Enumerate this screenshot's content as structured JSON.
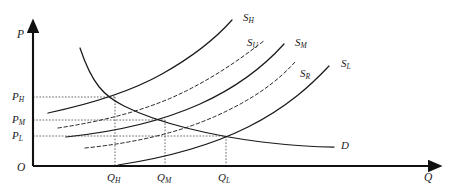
{
  "figure": {
    "kind": "supply-demand-diagram",
    "background": "#ffffff",
    "ink": "#1a1a1a",
    "guide_color": "#555555"
  },
  "axes": {
    "y_label": "P",
    "x_label": "Q",
    "origin_label": "O",
    "x_axis_y": 166,
    "y_axis_x": 33,
    "y_top": 27,
    "x_right": 436
  },
  "price_ticks": [
    {
      "id": "PH",
      "base": "P",
      "sub": "H",
      "y": 97
    },
    {
      "id": "PM",
      "base": "P",
      "sub": "M",
      "y": 120
    },
    {
      "id": "PL",
      "base": "P",
      "sub": "L",
      "y": 136
    }
  ],
  "quantity_ticks": [
    {
      "id": "QH",
      "base": "Q",
      "sub": "H",
      "x": 115
    },
    {
      "id": "QM",
      "base": "Q",
      "sub": "M",
      "x": 165
    },
    {
      "id": "QL",
      "base": "Q",
      "sub": "L",
      "x": 226
    }
  ],
  "equilibria": [
    {
      "name": "high",
      "price": "PH",
      "quantity": "QH",
      "x": 115,
      "y": 97
    },
    {
      "name": "medium",
      "price": "PM",
      "quantity": "QM",
      "x": 165,
      "y": 120
    },
    {
      "name": "low",
      "price": "PL",
      "quantity": "QL",
      "x": 226,
      "y": 136
    }
  ],
  "curves": [
    {
      "id": "SH",
      "base": "S",
      "sub": "H",
      "style": "solid",
      "label_x": 243,
      "label_y": 12,
      "path": "M 48,113 C 90,104 130,92 162,74 C 194,56 216,38 232,20"
    },
    {
      "id": "SU",
      "base": "S",
      "sub": "U",
      "style": "dashed",
      "label_x": 247,
      "label_y": 37,
      "path": "M 58,128 C 104,121 148,110 186,91 C 222,73 248,53 265,40"
    },
    {
      "id": "SM",
      "base": "S",
      "sub": "M",
      "style": "solid",
      "label_x": 295,
      "label_y": 37,
      "path": "M 66,137 C 114,132 160,122 200,104 C 240,86 266,64 284,44"
    },
    {
      "id": "SR",
      "base": "S",
      "sub": "R",
      "style": "dashed",
      "label_x": 300,
      "label_y": 68,
      "path": "M 85,148 C 134,143 178,133 216,116 C 254,99 278,81 295,62"
    },
    {
      "id": "SL",
      "base": "S",
      "sub": "L",
      "style": "solid",
      "label_x": 341,
      "label_y": 58,
      "path": "M 118,165 C 164,158 208,147 248,127 C 288,107 312,84 329,66"
    },
    {
      "id": "D",
      "base": "D",
      "sub": "",
      "style": "solid",
      "label_x": 341,
      "label_y": 140,
      "path": "M 80,48 C 92,84 104,96 124,106 C 160,124 214,136 262,142 C 296,146 322,147 334,147"
    }
  ]
}
